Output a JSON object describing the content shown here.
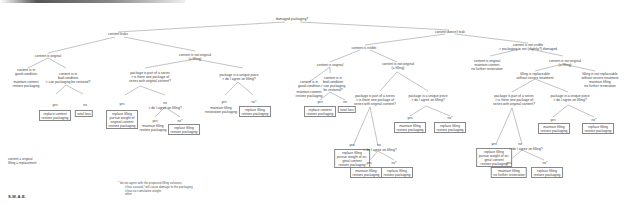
{
  "diagram": {
    "title": "damaged packaging?",
    "signature": "S.M.A.E.",
    "legend": [
      "content = original",
      "filling = replacement"
    ],
    "notes": {
      "header": "* do not agree with the proposed filling solutions",
      "items": [
        "it has caused / will cause damage to the packaging",
        "it has no cumulative weight",
        "other"
      ]
    },
    "nodes": {
      "root": [
        "damaged packaging?"
      ],
      "leaks": [
        "content leaks"
      ],
      "no_leak": [
        "content doesn't leak"
      ],
      "L_orig": [
        "content is original"
      ],
      "L_good": [
        "content is in",
        "good condition"
      ],
      "L_good_act": [
        "maintain content",
        "restore packaging"
      ],
      "L_bad": [
        "content is in",
        "bad condition",
        "> can packaging be restored?"
      ],
      "L_bad_yes": [
        "replace content",
        "restore packaging"
      ],
      "L_bad_no": [
        "total loss"
      ],
      "L_notorig": [
        "content is not original",
        "(= filling)"
      ],
      "L_series": [
        "package is part of a series",
        "> is there one package of",
        "series with original content?"
      ],
      "L_series_yes": [
        "replace filling",
        "pursue weight of",
        "original content",
        "restore packaging"
      ],
      "L_series_no": [
        "> do I agree on filling?"
      ],
      "L_series_no_yes": [
        "maintain filling",
        "restore packaging"
      ],
      "L_series_no_no": [
        "replace filling",
        "restore packaging"
      ],
      "L_unique": [
        "package is a unique piece",
        "> do I agree on filling?"
      ],
      "L_unique_yes": [
        "maintain filling",
        "restoration packaging"
      ],
      "L_unique_no": [
        "replace filling",
        "restore packaging"
      ],
      "V_visible": [
        "content is visible"
      ],
      "V_orig": [
        "content is original"
      ],
      "V_good": [
        "content is in",
        "good condition"
      ],
      "V_good_act": [
        "maintain content",
        "restore packaging"
      ],
      "V_bad": [
        "content is in",
        "bad condition",
        "> can packaging",
        "be restored?"
      ],
      "V_bad_yes": [
        "replace content",
        "restore packaging"
      ],
      "V_bad_no": [
        "total loss"
      ],
      "V_notorig": [
        "content is not original",
        "(= filling)"
      ],
      "V_series": [
        "package is part of a series",
        "> is there one package of",
        "series with original content?"
      ],
      "V_series_yes": [
        "replace filling",
        "pursue weight of ori-",
        "ginal content",
        "restore packaging"
      ],
      "V_series_no": [
        "> do I agree on filling?"
      ],
      "V_series_no_yes": [
        "maintain filling",
        "restore packaging"
      ],
      "V_series_no_no": [
        "replace filling",
        "restore packaging"
      ],
      "V_unique": [
        "package is a unique piece",
        "> do I agree on filling?"
      ],
      "V_unique_yes": [
        "maintain filling",
        "restore packaging"
      ],
      "V_unique_no": [
        "replace filling",
        "restore packaging"
      ],
      "N_notvisible": [
        "content is not visible",
        "> packaging is not (slightly?) damaged"
      ],
      "N_orig": [
        "content is original",
        "maintain content",
        "no further restoration"
      ],
      "N_notorig": [
        "content is not original",
        "(= filling)"
      ],
      "N_repl": [
        "filling is replaceable",
        "without severe treatment"
      ],
      "N_notrepl": [
        "filling is not replaceable",
        "without severe treatment",
        "maintain filling",
        "no further restoration"
      ],
      "N_series": [
        "package is part of a series",
        "> is there one package of",
        "series with original content?"
      ],
      "N_series_yes": [
        "replace filling",
        "pursue weight of ori-",
        "ginal content",
        "restore packaging"
      ],
      "N_series_no": [
        "> do I agree on filling?"
      ],
      "N_series_no_yes": [
        "maintain filling",
        "no further restoration"
      ],
      "N_series_no_no": [
        "replace filling",
        "restore packaging"
      ],
      "N_unique": [
        "package is a unique piece",
        "> do I agree on filling?"
      ],
      "N_unique_yes": [
        "maintain filling",
        "restore packaging"
      ],
      "N_unique_no": [
        "replace filling",
        "restore packaging"
      ]
    },
    "edge_labels": {
      "yes": "yes",
      "no": "no",
      "no_star": "no*"
    }
  }
}
